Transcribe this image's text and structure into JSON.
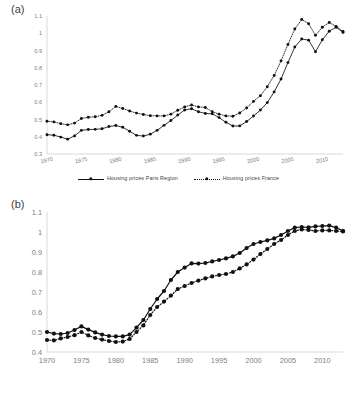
{
  "panels": {
    "a": {
      "label": "(a)"
    },
    "b": {
      "label": "(b)"
    }
  },
  "legend_a": {
    "items": [
      {
        "label": "Housing prices Paris Region",
        "style": "solid"
      },
      {
        "label": "Housing prices France",
        "style": "dotted"
      }
    ]
  },
  "legend_b": {
    "items": [
      {
        "label": "France rents",
        "style": "dotted"
      },
      {
        "label": "Paris region rents",
        "style": "solid"
      }
    ]
  },
  "colors": {
    "line": "#111111",
    "marker": "#111111",
    "axis": "#d9d9d9",
    "tick_text": "#808080",
    "panel_label": "#404040"
  },
  "chart_data": [
    {
      "id": "a",
      "type": "line",
      "title": "",
      "xlabel": "",
      "ylabel": "",
      "xlim": [
        1970,
        2013
      ],
      "ylim": [
        0.3,
        1.1
      ],
      "ytick_labels": [
        "0.3",
        "0.4",
        "0.5",
        "0.6",
        "0.7",
        "0.8",
        "0.9",
        "1",
        "1.1"
      ],
      "yticks": [
        0.3,
        0.4,
        0.5,
        0.6,
        0.7,
        0.8,
        0.9,
        1.0,
        1.1
      ],
      "xtick_labels": [
        "1970",
        "1975",
        "1980",
        "1985",
        "1990",
        "1995",
        "2000",
        "2005",
        "2010"
      ],
      "xticks": [
        1970,
        1975,
        1980,
        1985,
        1990,
        1995,
        2000,
        2005,
        2010
      ],
      "xtick_rotation": -12,
      "grid": false,
      "legend_position": "bottom",
      "x": [
        1970,
        1971,
        1972,
        1973,
        1974,
        1975,
        1976,
        1977,
        1978,
        1979,
        1980,
        1981,
        1982,
        1983,
        1984,
        1985,
        1986,
        1987,
        1988,
        1989,
        1990,
        1991,
        1992,
        1993,
        1994,
        1995,
        1996,
        1997,
        1998,
        1999,
        2000,
        2001,
        2002,
        2003,
        2004,
        2005,
        2006,
        2007,
        2008,
        2009,
        2010,
        2011,
        2012,
        2013
      ],
      "series": [
        {
          "name": "Housing prices Paris Region",
          "style": "solid",
          "values": [
            0.412,
            0.409,
            0.398,
            0.386,
            0.405,
            0.437,
            0.442,
            0.443,
            0.446,
            0.459,
            0.465,
            0.455,
            0.432,
            0.408,
            0.404,
            0.415,
            0.437,
            0.466,
            0.494,
            0.526,
            0.555,
            0.562,
            0.545,
            0.535,
            0.533,
            0.511,
            0.484,
            0.462,
            0.463,
            0.488,
            0.52,
            0.555,
            0.598,
            0.66,
            0.735,
            0.83,
            0.92,
            0.967,
            0.96,
            0.893,
            0.962,
            1.012,
            1.035,
            1.005
          ]
        },
        {
          "name": "Housing prices France",
          "style": "dotted",
          "values": [
            0.49,
            0.486,
            0.476,
            0.469,
            0.479,
            0.506,
            0.513,
            0.516,
            0.524,
            0.545,
            0.576,
            0.564,
            0.549,
            0.537,
            0.529,
            0.522,
            0.521,
            0.521,
            0.531,
            0.554,
            0.573,
            0.584,
            0.573,
            0.57,
            0.545,
            0.531,
            0.521,
            0.519,
            0.538,
            0.567,
            0.605,
            0.638,
            0.69,
            0.755,
            0.84,
            0.935,
            1.025,
            1.08,
            1.055,
            0.988,
            1.035,
            1.062,
            1.04,
            1.01
          ]
        }
      ]
    },
    {
      "id": "b",
      "type": "line",
      "title": "",
      "xlabel": "",
      "ylabel": "",
      "xlim": [
        1970,
        2013
      ],
      "ylim": [
        0.4,
        1.1
      ],
      "ytick_labels": [
        "0.4",
        "0.5",
        "0.6",
        "0.7",
        "0.8",
        "0.9",
        "1",
        "1.1"
      ],
      "yticks": [
        0.4,
        0.5,
        0.6,
        0.7,
        0.8,
        0.9,
        1.0,
        1.1
      ],
      "xtick_labels": [
        "1970",
        "1975",
        "1980",
        "1985",
        "1990",
        "1995",
        "2000",
        "2005",
        "2010"
      ],
      "xticks": [
        1970,
        1975,
        1980,
        1985,
        1990,
        1995,
        2000,
        2005,
        2010
      ],
      "xtick_rotation": 0,
      "grid": false,
      "legend_position": "bottom",
      "x": [
        1970,
        1971,
        1972,
        1973,
        1974,
        1975,
        1976,
        1977,
        1978,
        1979,
        1980,
        1981,
        1982,
        1983,
        1984,
        1985,
        1986,
        1987,
        1988,
        1989,
        1990,
        1991,
        1992,
        1993,
        1994,
        1995,
        1996,
        1997,
        1998,
        1999,
        2000,
        2001,
        2002,
        2003,
        2004,
        2005,
        2006,
        2007,
        2008,
        2009,
        2010,
        2011,
        2012,
        2013
      ],
      "series": [
        {
          "name": "France rents",
          "style": "dotted",
          "values": [
            0.46,
            0.458,
            0.468,
            0.475,
            0.484,
            0.5,
            0.483,
            0.47,
            0.462,
            0.455,
            0.45,
            0.452,
            0.465,
            0.5,
            0.533,
            0.585,
            0.625,
            0.652,
            0.682,
            0.715,
            0.73,
            0.745,
            0.757,
            0.768,
            0.778,
            0.785,
            0.79,
            0.8,
            0.818,
            0.838,
            0.862,
            0.89,
            0.915,
            0.94,
            0.96,
            0.985,
            1.005,
            1.013,
            1.01,
            1.005,
            1.008,
            1.008,
            1.005,
            1.003
          ]
        },
        {
          "name": "Paris region rents",
          "style": "solid",
          "values": [
            0.5,
            0.492,
            0.49,
            0.495,
            0.51,
            0.528,
            0.512,
            0.498,
            0.487,
            0.48,
            0.478,
            0.478,
            0.487,
            0.522,
            0.56,
            0.615,
            0.665,
            0.705,
            0.76,
            0.8,
            0.822,
            0.843,
            0.842,
            0.845,
            0.853,
            0.86,
            0.868,
            0.878,
            0.895,
            0.92,
            0.94,
            0.95,
            0.958,
            0.968,
            0.985,
            1.005,
            1.022,
            1.025,
            1.023,
            1.028,
            1.03,
            1.032,
            1.022,
            1.005
          ]
        }
      ]
    }
  ]
}
